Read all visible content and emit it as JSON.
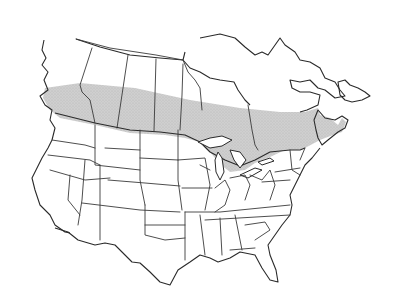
{
  "map": {
    "subject": "Range map of North America",
    "region": "Canada and contiguous United States",
    "features": [
      "province boundaries",
      "state boundaries",
      "Great Lakes",
      "coastlines"
    ],
    "range_fill_color": "#c8c8c8",
    "line_color": "#3a3a3a",
    "background_color": "#ffffff",
    "shaded_range_description": "Band across southern Canada from British Columbia coast to Nova Scotia, including southern Ontario and St. Lawrence valley",
    "legend": null,
    "caption": ""
  }
}
